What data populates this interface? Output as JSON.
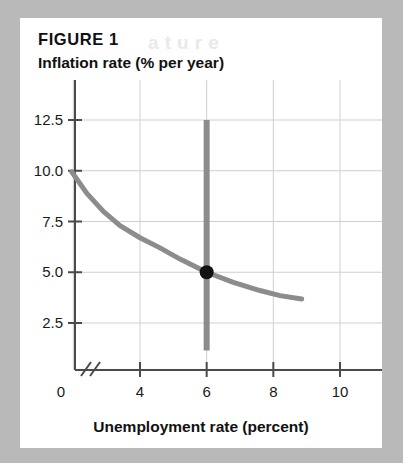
{
  "figure": {
    "label": "FIGURE 1",
    "ghost_text": "a t  u r e",
    "card_background": "#ffffff",
    "page_background": "#b9b9b9"
  },
  "chart_data": {
    "type": "line",
    "title": "FIGURE 1",
    "xlabel": "Unemployment rate (percent)",
    "ylabel": "Inflation rate (% per year)",
    "xlim": [
      1.2,
      11.0
    ],
    "ylim": [
      1.0,
      13.4
    ],
    "grid": true,
    "legend": "none",
    "axis_break": {
      "axis": "x",
      "symbol": "//",
      "after_value": 0,
      "note": "x-axis broken between 0 and first plotted value"
    },
    "xticks": [
      0,
      4,
      6,
      8,
      10
    ],
    "xtick_labels": [
      "0",
      "4",
      "6",
      "8",
      "10"
    ],
    "yticks": [
      2.5,
      5.0,
      7.5,
      10.0,
      12.5
    ],
    "ytick_labels": [
      "2.5",
      "5.0",
      "7.5",
      "10.0",
      "12.5"
    ],
    "x_gridlines": [
      2,
      4,
      6,
      8,
      10
    ],
    "y_gridlines": [
      2.5,
      5.0,
      7.5,
      10.0,
      12.5
    ],
    "series": [
      {
        "name": "Short-run Phillips curve",
        "type": "line",
        "color": "#8c8c8c",
        "width": 5,
        "points": [
          {
            "x": 1.95,
            "y": 9.95
          },
          {
            "x": 2.4,
            "y": 8.9
          },
          {
            "x": 2.9,
            "y": 8.0
          },
          {
            "x": 3.4,
            "y": 7.3
          },
          {
            "x": 4.0,
            "y": 6.7
          },
          {
            "x": 4.6,
            "y": 6.2
          },
          {
            "x": 5.2,
            "y": 5.65
          },
          {
            "x": 6.0,
            "y": 5.0
          },
          {
            "x": 6.8,
            "y": 4.5
          },
          {
            "x": 7.6,
            "y": 4.1
          },
          {
            "x": 8.2,
            "y": 3.85
          },
          {
            "x": 8.85,
            "y": 3.68
          }
        ]
      },
      {
        "name": "Long-run Phillips curve (natural rate)",
        "type": "vline",
        "color": "#8c8c8c",
        "width": 6,
        "x": 6.0,
        "y_from": 1.15,
        "y_to": 12.5
      }
    ],
    "markers": [
      {
        "name": "equilibrium-point",
        "x": 6.0,
        "y": 5.0,
        "color": "#111111",
        "radius": 7
      }
    ]
  }
}
